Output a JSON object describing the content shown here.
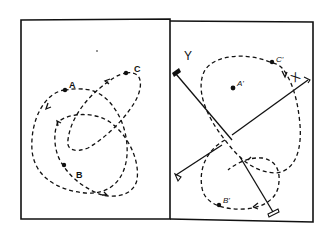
{
  "figure": {
    "panels": [
      {
        "id": "left",
        "description": "Three overlapping dashed closed trajectories with marked points",
        "points": [
          {
            "label": "A"
          },
          {
            "label": "B"
          },
          {
            "label": "C"
          }
        ]
      },
      {
        "id": "right",
        "description": "Rotated X/Y axes with dashed figure-eight trajectory and transformed points",
        "axes": [
          {
            "label": "Y"
          },
          {
            "label": "X"
          }
        ],
        "points": [
          {
            "label": "A'"
          },
          {
            "label": "B'"
          },
          {
            "label": "C'"
          }
        ]
      }
    ],
    "colors": {
      "ink": "#111111",
      "background": "#ffffff"
    }
  }
}
